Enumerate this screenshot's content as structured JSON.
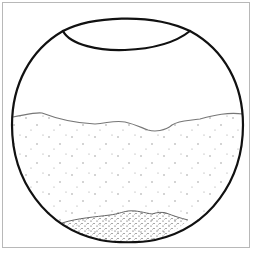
{
  "figure": {
    "frame_color": "#b8b8b8",
    "outline_color": "#111111",
    "water_line_color": "#777777",
    "dot_color": "#888888",
    "sediment_dot_color": "#333333",
    "parts": [
      {
        "name": "vessel-outline",
        "label": "Vessel"
      },
      {
        "name": "vessel-opening",
        "label": "Opening"
      },
      {
        "name": "liquid-surface",
        "label": "Liquid surface"
      },
      {
        "name": "suspended-particles",
        "label": "Suspended particles"
      },
      {
        "name": "sediment-layer",
        "label": "Sediment"
      }
    ]
  }
}
